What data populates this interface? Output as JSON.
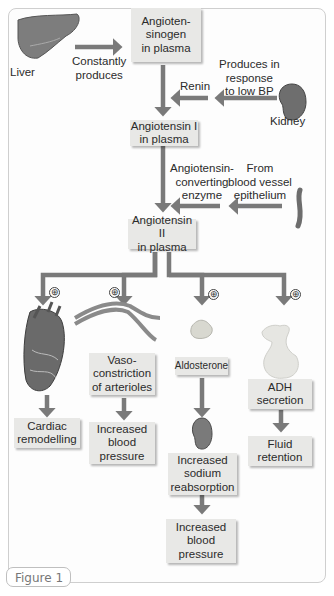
{
  "figure": {
    "caption_tab": "Figure 1",
    "colors": {
      "arrow": "#7a7a7a",
      "box_fill": "#e8e8e6",
      "text": "#2b2b2b"
    }
  },
  "nodes": {
    "liver_label": "Liver",
    "constantly_produces_1": "Constantly",
    "constantly_produces_2": "produces",
    "angiotensinogen_1": "Angioten-",
    "angiotensinogen_2": "sinogen",
    "angiotensinogen_3": "in plasma",
    "produces_low_bp_1": "Produces in",
    "produces_low_bp_2": "response",
    "produces_low_bp_3": "to low BP",
    "renin": "Renin",
    "kidney_label": "Kidney",
    "angiotensin1_1": "Angiotensin I",
    "angiotensin1_2": "in plasma",
    "ace_1": "Angiotensin-",
    "ace_2": "converting",
    "ace_3": "enzyme",
    "from_vessel_1": "From",
    "from_vessel_2": "blood vessel",
    "from_vessel_3": "epithelium",
    "angiotensin2_1": "Angiotensin II",
    "angiotensin2_2": "in plasma",
    "plus_symbol": "⊕",
    "vaso_1": "Vaso-",
    "vaso_2": "constriction",
    "vaso_3": "of arterioles",
    "aldosterone": "Aldosterone",
    "adh_1": "ADH",
    "adh_2": "secretion",
    "cardiac_1": "Cardiac",
    "cardiac_2": "remodelling",
    "ibp_a_1": "Increased",
    "ibp_a_2": "blood",
    "ibp_a_3": "pressure",
    "sodium_1": "Increased",
    "sodium_2": "sodium",
    "sodium_3": "reabsorption",
    "fluid_1": "Fluid",
    "fluid_2": "retention",
    "ibp_b_1": "Increased",
    "ibp_b_2": "blood",
    "ibp_b_3": "pressure"
  }
}
